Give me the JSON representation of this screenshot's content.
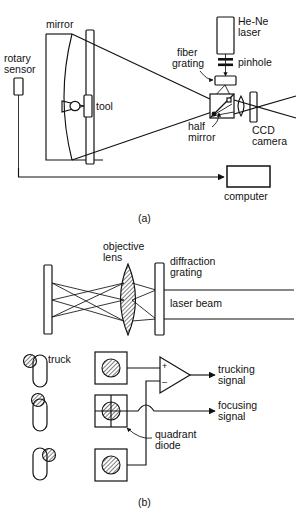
{
  "figure": {
    "title_a": "(a)",
    "title_b": "(b)",
    "background_color": "#ffffff",
    "line_color": "#111111"
  },
  "panel_a": {
    "caption": "(a)",
    "labels": {
      "rotary_sensor_line1": "rotary",
      "rotary_sensor_line2": "sensor",
      "mirror": "mirror",
      "tool": "tool",
      "fiber_line1": "fiber",
      "fiber_line2": "grating",
      "laser_line1": "He-Ne",
      "laser_line2": "laser",
      "pinhole": "pinhole",
      "half_mirror_line1": "half",
      "half_mirror_line2": "mirror",
      "ccd_line1": "CCD",
      "ccd_line2": "camera",
      "computer": "computer"
    },
    "components": [
      "rotary-sensor",
      "concave-mirror",
      "tool",
      "he-ne-laser",
      "pinhole",
      "fiber-grating",
      "half-mirror",
      "ccd-camera",
      "computer"
    ]
  },
  "panel_b": {
    "caption": "(b)",
    "labels": {
      "objective_line1": "objective",
      "objective_line2": "lens",
      "diffraction_line1": "diffraction",
      "diffraction_line2": "grating",
      "laser_beam": "laser beam",
      "truck": "truck",
      "trucking_line1": "trucking",
      "trucking_line2": "signal",
      "focusing_line1": "focusing",
      "focusing_line2": "signal",
      "quadrant_line1": "quadrant",
      "quadrant_line2": "diode"
    },
    "amplifier": {
      "plus": "+",
      "minus": "–"
    },
    "components": [
      "reflector-plate",
      "objective-lens",
      "diffraction-grating",
      "laser-beam",
      "truck-top",
      "truck-middle",
      "truck-bottom",
      "photodiode-top",
      "quadrant-diode",
      "photodiode-bottom",
      "differential-amplifier"
    ]
  }
}
